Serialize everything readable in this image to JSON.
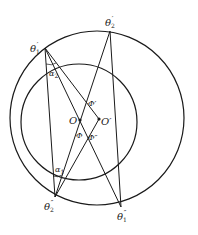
{
  "diagram": {
    "type": "geometry",
    "circles": [
      {
        "name": "outer-circle",
        "cx": 97,
        "cy": 118,
        "r": 87
      },
      {
        "name": "inner-circle",
        "cx": 79,
        "cy": 122,
        "r": 58
      }
    ],
    "points": {
      "theta1p": {
        "x": 45,
        "y": 48,
        "label": "θ",
        "sub": "1",
        "sup": "′"
      },
      "theta2p": {
        "x": 110,
        "y": 31,
        "label": "θ",
        "sub": "2",
        "sup": "′"
      },
      "O": {
        "x": 80,
        "y": 120,
        "label": "O"
      },
      "Op": {
        "x": 99,
        "y": 119,
        "label": "O′"
      },
      "theta2pp": {
        "x": 55,
        "y": 197,
        "label": "θ",
        "sub": "2",
        "sup": "″"
      },
      "theta1pp": {
        "x": 121,
        "y": 207,
        "label": "θ",
        "sub": "1",
        "sup": "″"
      }
    },
    "angle_labels": {
      "alpha2": {
        "label": "α",
        "sub": "2"
      },
      "alpha1": {
        "label": "α",
        "sub": "1"
      },
      "Phi": "Φ",
      "Phi_prime": "Φ′",
      "Phi_dprime": "Φ″"
    },
    "line_color": "#1a1a1a"
  }
}
